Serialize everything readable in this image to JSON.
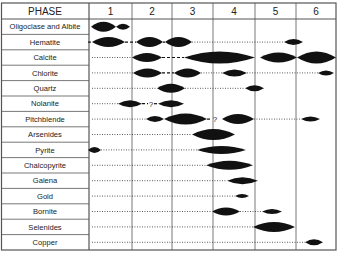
{
  "chart_data": {
    "type": "paragenetic-diagram",
    "title": "",
    "header_label": "PHASE",
    "phases": [
      "1",
      "2",
      "3",
      "4",
      "5",
      "6"
    ],
    "grid": {
      "left": 89,
      "right": 336,
      "top": 3,
      "header_bottom": 19,
      "bottom": 250,
      "phase_edges": [
        89,
        132,
        172,
        213,
        255,
        296,
        336
      ]
    },
    "minerals": [
      {
        "name": "Oligoclase and Albite",
        "bars": [
          [
            91,
            116,
            5
          ],
          [
            116,
            130,
            3
          ]
        ],
        "dotted": [],
        "dashed": [],
        "question": []
      },
      {
        "name": "Hematite",
        "bars": [
          [
            92,
            125,
            5
          ],
          [
            136,
            163,
            5
          ],
          [
            165,
            192,
            5
          ],
          [
            284,
            303,
            3
          ]
        ],
        "dotted": [
          [
            192,
            284
          ]
        ],
        "dashed": [
          [
            88,
            92
          ],
          [
            125,
            136
          ],
          [
            163,
            165
          ]
        ],
        "question": []
      },
      {
        "name": "Calcite",
        "bars": [
          [
            132,
            162,
            4.5
          ],
          [
            184,
            255,
            6
          ],
          [
            260,
            297,
            5
          ],
          [
            297,
            336,
            6
          ]
        ],
        "dotted": [
          [
            92,
            132
          ]
        ],
        "dashed": [
          [
            162,
            184
          ]
        ],
        "question": []
      },
      {
        "name": "Chlorite",
        "bars": [
          [
            133,
            162,
            4.5
          ],
          [
            174,
            201,
            4.5
          ],
          [
            222,
            247,
            3.5
          ],
          [
            318,
            334,
            2.5
          ]
        ],
        "dotted": [
          [
            92,
            133
          ],
          [
            201,
            222
          ],
          [
            247,
            318
          ]
        ],
        "dashed": [
          [
            162,
            174
          ]
        ],
        "question": []
      },
      {
        "name": "Quartz",
        "bars": [
          [
            157,
            185,
            4.5
          ],
          [
            245,
            264,
            3
          ]
        ],
        "dotted": [
          [
            92,
            157
          ],
          [
            185,
            245
          ]
        ],
        "dashed": [],
        "question": []
      },
      {
        "name": "Nolanite",
        "bars": [
          [
            118,
            142,
            3.5
          ],
          [
            158,
            184,
            3.5
          ]
        ],
        "dotted": [
          [
            92,
            118
          ]
        ],
        "dashed": [
          [
            142,
            148
          ],
          [
            154,
            158
          ]
        ],
        "question": [
          [
            151,
            106
          ]
        ]
      },
      {
        "name": "Pitchblende",
        "bars": [
          [
            146,
            164,
            3
          ],
          [
            164,
            207,
            5.5
          ],
          [
            222,
            254,
            5
          ],
          [
            301,
            320,
            2.5
          ]
        ],
        "dotted": [
          [
            92,
            146
          ],
          [
            254,
            301
          ]
        ],
        "dashed": [
          [
            207,
            212
          ]
        ],
        "question": [
          [
            215,
            125
          ]
        ]
      },
      {
        "name": "Arsenides",
        "bars": [
          [
            192,
            235,
            5.5
          ]
        ],
        "dotted": [
          [
            92,
            192
          ]
        ],
        "dashed": [],
        "question": []
      },
      {
        "name": "Pyrite",
        "bars": [
          [
            88,
            101,
            3
          ],
          [
            197,
            246,
            4
          ]
        ],
        "dotted": [
          [
            101,
            197
          ]
        ],
        "dashed": [],
        "question": []
      },
      {
        "name": "Chalcopyrite",
        "bars": [
          [
            206,
            253,
            4.5
          ]
        ],
        "dotted": [
          [
            92,
            206
          ]
        ],
        "dashed": [],
        "question": []
      },
      {
        "name": "Galena",
        "bars": [
          [
            227,
            258,
            3.5
          ]
        ],
        "dotted": [
          [
            92,
            227
          ]
        ],
        "dashed": [],
        "question": []
      },
      {
        "name": "Gold",
        "bars": [
          [
            235,
            249,
            2
          ]
        ],
        "dotted": [
          [
            92,
            235
          ]
        ],
        "dashed": [],
        "question": []
      },
      {
        "name": "Bornite",
        "bars": [
          [
            212,
            240,
            4
          ],
          [
            262,
            282,
            2.5
          ]
        ],
        "dotted": [
          [
            92,
            212
          ],
          [
            240,
            262
          ]
        ],
        "dashed": [],
        "question": [
          [
            272,
            215
          ]
        ]
      },
      {
        "name": "Selenides",
        "bars": [
          [
            253,
            295,
            5
          ]
        ],
        "dotted": [
          [
            92,
            253
          ]
        ],
        "dashed": [],
        "question": []
      },
      {
        "name": "Copper",
        "bars": [
          [
            305,
            323,
            3
          ]
        ],
        "dotted": [
          [
            92,
            305
          ]
        ],
        "dashed": [],
        "question": []
      }
    ],
    "question_mark": "?",
    "colors": {
      "ink": "#111111",
      "grid": "#555555",
      "dots": "#333333"
    }
  }
}
